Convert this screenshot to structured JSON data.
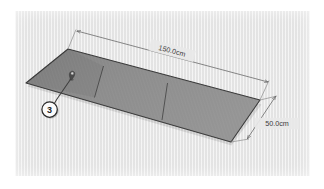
{
  "figure": {
    "type": "isometric-technical-illustration",
    "background_color": "#e8e8e8",
    "panel_fill_color": "#8a8a8a",
    "outline_color": "#3a3a3a",
    "dimension_line_color": "#6b6b6b",
    "label_text_color": "#3b3b3b"
  },
  "dimensions": [
    {
      "id": "length",
      "label": "150.0cm",
      "value": 150.0,
      "unit": "cm",
      "position": "top",
      "orientation": "along-long-edge"
    },
    {
      "id": "width",
      "label": "50.0cm",
      "value": 50.0,
      "unit": "cm",
      "position": "right",
      "orientation": "along-short-edge"
    }
  ],
  "callouts": [
    {
      "id": "callout-3",
      "label": "3",
      "badge_shape": "circle",
      "badge_fill": "#fbfbfb",
      "badge_border": "#2a2a2a",
      "leader_target": "surface-marker-pin"
    }
  ],
  "markers": [
    {
      "id": "surface-marker-pin",
      "icon_name": "map-pin-icon",
      "color": "#4a4a4a"
    }
  ],
  "panels": {
    "count": 3,
    "divider_count": 2,
    "divider_color": "#4a4a4a"
  }
}
